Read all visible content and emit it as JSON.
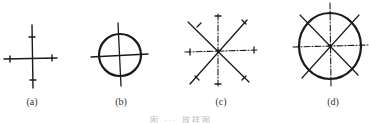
{
  "figures": [
    {
      "id": "a",
      "label": "(a)",
      "type": "cross-with-ticks"
    },
    {
      "id": "b",
      "label": "(b)",
      "type": "circle-with-cross"
    },
    {
      "id": "c",
      "label": "(c)",
      "type": "eight-spoke-star-with-ticks"
    },
    {
      "id": "d",
      "label": "(d)",
      "type": "circle-with-eight-spokes"
    }
  ],
  "caption": "图 ··· 放样图",
  "colors": {
    "ink": "#1a1a1a",
    "background": "#ffffff"
  }
}
